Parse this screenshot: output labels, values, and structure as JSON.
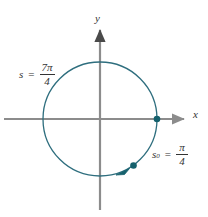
{
  "figure": {
    "type": "unit-circle-arc-diagram",
    "background_color": "#ffffff",
    "axes": {
      "x_label": "x",
      "y_label": "y",
      "axis_color": "#8c8c8c",
      "origin": {
        "x": 100,
        "y": 119
      },
      "x_axis_extent": [
        4,
        186
      ],
      "y_axis_extent": [
        28,
        210
      ]
    },
    "circle": {
      "center_x": 100,
      "center_y": 119,
      "radius": 57,
      "stroke_color": "#2e6e7e",
      "stroke_width": 1.2
    },
    "points": [
      {
        "name": "point-initial",
        "label": "(1, 0)",
        "angle_degrees": 0,
        "x": 157,
        "y": 119,
        "radius": 3.2,
        "color": "#15616d"
      },
      {
        "name": "point-terminal",
        "label": "terminal point at 7pi/4",
        "angle_degrees": 315,
        "x": 133,
        "y": 166,
        "radius": 3.2,
        "color": "#15616d"
      }
    ],
    "arrow_marker": {
      "name": "arc-direction-arrowhead",
      "x": 122,
      "y": 172,
      "color": "#15616d"
    },
    "labels": {
      "arc_total": {
        "variable": "s",
        "subscript": "",
        "equals": "=",
        "numerator": "7π",
        "denominator": "4",
        "full_text": "s = 7π/4"
      },
      "arc_reference": {
        "variable": "s",
        "subscript": "0",
        "equals": "=",
        "numerator": "π",
        "denominator": "4",
        "full_text": "s₀ = π/4"
      }
    }
  }
}
